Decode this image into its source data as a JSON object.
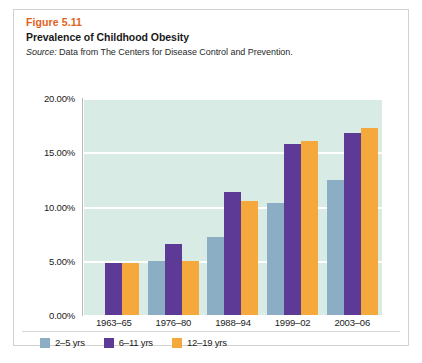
{
  "figure": {
    "number": "Figure 5.11",
    "title": "Prevalence of Childhood Obesity",
    "source_label": "Source:",
    "source_text": " Data from The Centers for Disease Control and Prevention."
  },
  "colors": {
    "age_2_5": "#8BAEC4",
    "age_6_11": "#5D3A96",
    "age_12_19": "#F5A83C",
    "plot_background": "#D8EBE5",
    "gridline": "#FFFFFF",
    "figure_number": "#E2611C"
  },
  "chart_data": {
    "type": "bar",
    "title": "Prevalence of Childhood Obesity",
    "subtitle": "Source: Data from The Centers for Disease Control and Prevention.",
    "xlabel": "",
    "ylabel": "",
    "categories": [
      "1963–65",
      "1976–80",
      "1988–94",
      "1999–02",
      "2003–06"
    ],
    "series": [
      {
        "name": "2–5 yrs",
        "color": "#8BAEC4",
        "values": [
          null,
          5.0,
          7.2,
          10.3,
          12.4
        ]
      },
      {
        "name": "6–11 yrs",
        "color": "#5D3A96",
        "values": [
          4.8,
          6.5,
          11.3,
          15.8,
          16.8
        ]
      },
      {
        "name": "12–19 yrs",
        "color": "#F5A83C",
        "values": [
          4.8,
          5.0,
          10.5,
          16.0,
          17.2
        ]
      }
    ],
    "ylim": [
      0,
      20
    ],
    "y_ticks": [
      0,
      5,
      10,
      15,
      20
    ],
    "y_tick_labels": [
      "0.00%",
      "5.00%",
      "10.00%",
      "15.00%",
      "20.00%"
    ],
    "value_suffix": "%",
    "grid": true,
    "grid_axis": "y",
    "legend_position": "bottom-left"
  }
}
